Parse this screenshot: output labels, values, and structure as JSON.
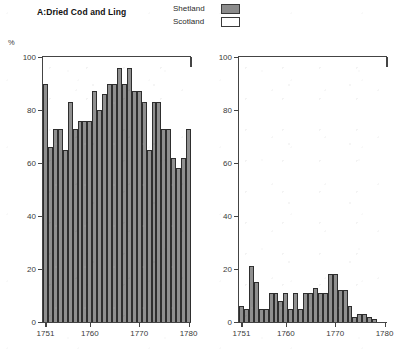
{
  "figure": {
    "legend": {
      "entries": [
        {
          "label": "Shetland",
          "swatch": "shetland-swatch",
          "color": "#8f8f8f"
        },
        {
          "label": "Scotland",
          "swatch": "scotland-swatch",
          "color": "#ffffff"
        }
      ]
    },
    "percent_symbol": "%"
  },
  "chart_data": [
    {
      "type": "bar",
      "title": "A:Dried Cod and Ling",
      "xlabel": "",
      "ylabel": "%",
      "xlim": [
        1750.5,
        1780.5
      ],
      "ylim": [
        0,
        100
      ],
      "yticks": [
        0,
        20,
        40,
        60,
        80,
        100
      ],
      "xticks": [
        1751,
        1760,
        1770,
        1780
      ],
      "grid": false,
      "legend_position": "top-center",
      "series": [
        {
          "name": "Shetland",
          "color": "#8f8f8f",
          "x": [
            1751,
            1752,
            1753,
            1754,
            1755,
            1756,
            1757,
            1758,
            1759,
            1760,
            1761,
            1762,
            1763,
            1764,
            1765,
            1766,
            1767,
            1768,
            1769,
            1770,
            1771,
            1772,
            1773,
            1774,
            1775,
            1776,
            1777,
            1778,
            1779,
            1780
          ],
          "values": [
            90,
            66,
            73,
            73,
            65,
            83,
            73,
            76,
            76,
            76,
            87,
            80,
            86,
            90,
            90,
            96,
            90,
            96,
            87,
            87,
            83,
            65,
            83,
            83,
            73,
            73,
            62,
            58,
            62,
            73
          ]
        }
      ]
    },
    {
      "type": "bar",
      "title": "B:White Herring",
      "xlabel": "",
      "ylabel": "%",
      "xlim": [
        1750.5,
        1780.5
      ],
      "ylim": [
        0,
        100
      ],
      "yticks": [
        0,
        20,
        40,
        60,
        80,
        100
      ],
      "xticks": [
        1751,
        1760,
        1770,
        1780
      ],
      "grid": false,
      "legend_position": "top-center",
      "series": [
        {
          "name": "Shetland",
          "color": "#8f8f8f",
          "x": [
            1751,
            1752,
            1753,
            1754,
            1755,
            1756,
            1757,
            1758,
            1759,
            1760,
            1761,
            1762,
            1763,
            1764,
            1765,
            1766,
            1767,
            1768,
            1769,
            1770,
            1771,
            1772,
            1773,
            1774,
            1775,
            1776,
            1777,
            1778,
            1779,
            1780
          ],
          "values": [
            6,
            5,
            21,
            15,
            5,
            5,
            11,
            11,
            8,
            11,
            5,
            11,
            5,
            11,
            11,
            13,
            11,
            11,
            18,
            18,
            12,
            12,
            6,
            2,
            3,
            3,
            2,
            1,
            0,
            0
          ]
        }
      ]
    }
  ]
}
